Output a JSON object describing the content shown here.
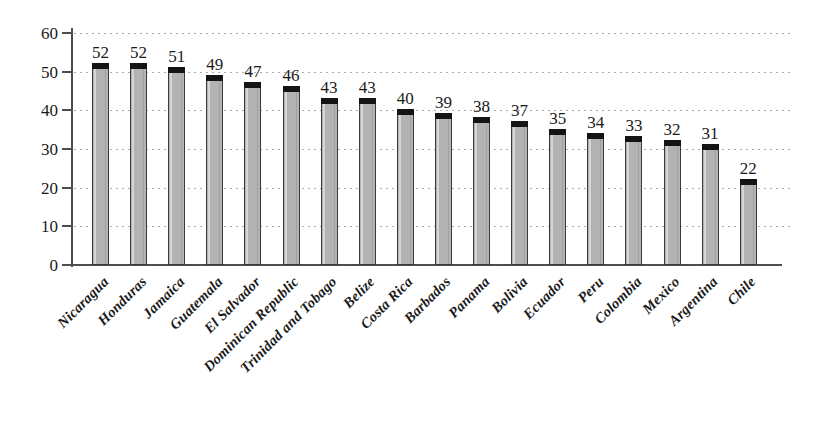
{
  "chart_data": {
    "type": "bar",
    "title": "",
    "subtitle": "",
    "xlabel": "",
    "ylabel": "",
    "ylim": [
      0,
      60
    ],
    "yticks": [
      0,
      10,
      20,
      30,
      40,
      50,
      60
    ],
    "grid": "horizontal-dotted",
    "legend": "none",
    "orientation": "vertical",
    "categories": [
      "Nicaragua",
      "Honduras",
      "Jamaica",
      "Guatemala",
      "El Salvador",
      "Dominican Republic",
      "Trinidad and Tobago",
      "Belize",
      "Costa Rica",
      "Barbados",
      "Panama",
      "Bolivia",
      "Ecuador",
      "Peru",
      "Colombia",
      "Mexico",
      "Argentina",
      "Chile"
    ],
    "values": [
      52,
      52,
      51,
      49,
      47,
      46,
      43,
      43,
      40,
      39,
      38,
      37,
      35,
      34,
      33,
      32,
      31,
      22
    ],
    "value_labels": [
      "52",
      "52",
      "51",
      "49",
      "47",
      "46",
      "43",
      "43",
      "40",
      "39",
      "38",
      "37",
      "35",
      "34",
      "33",
      "32",
      "31",
      "22"
    ],
    "ytick_labels": [
      "0",
      "10",
      "20",
      "30",
      "40",
      "50",
      "60"
    ],
    "colors": {
      "bar_fill": "#b3b3b3",
      "bar_outline": "#3a3a3a",
      "bar_cap": "#141414",
      "axis": "#4d4d4d",
      "gridline": "#aaaaaa",
      "text": "#1a1a1a",
      "background": "#ffffff"
    }
  }
}
